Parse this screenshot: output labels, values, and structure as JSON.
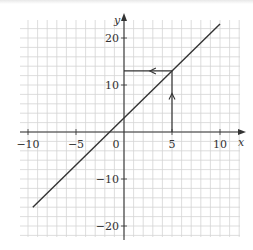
{
  "chart_data": {
    "type": "line",
    "title": "",
    "xlabel": "x",
    "ylabel": "y",
    "xlim": [
      -10.5,
      12
    ],
    "ylim": [
      -23,
      24
    ],
    "grid": true,
    "x_grid_step": 1,
    "y_grid_step": 2,
    "x_ticks": [
      -10,
      -5,
      0,
      5,
      10
    ],
    "x_tick_labels": [
      "−10",
      "−5",
      "0",
      "5",
      "10"
    ],
    "y_ticks": [
      -20,
      -10,
      10,
      20
    ],
    "y_tick_labels": [
      "−20",
      "−10",
      "10",
      "20"
    ],
    "series": [
      {
        "name": "y = 2x + 3",
        "x": [
          -9.5,
          10
        ],
        "y": [
          -16,
          23
        ],
        "color": "#333333"
      }
    ],
    "annotations": [
      {
        "type": "arrow-path",
        "description": "vertical from (5,0) up to (5,13) with upward arrowhead",
        "from": [
          5,
          0
        ],
        "to": [
          5,
          13
        ],
        "arrow_at": [
          5,
          8
        ]
      },
      {
        "type": "arrow-path",
        "description": "horizontal from (5,13) left to (0,13) with leftward arrowhead",
        "from": [
          5,
          13
        ],
        "to": [
          0,
          13
        ],
        "arrow_at": [
          2.8,
          13
        ]
      }
    ]
  },
  "colors": {
    "grid": "#d4d4d4",
    "axis": "#333333",
    "line": "#333333",
    "background": "#ffffff"
  }
}
